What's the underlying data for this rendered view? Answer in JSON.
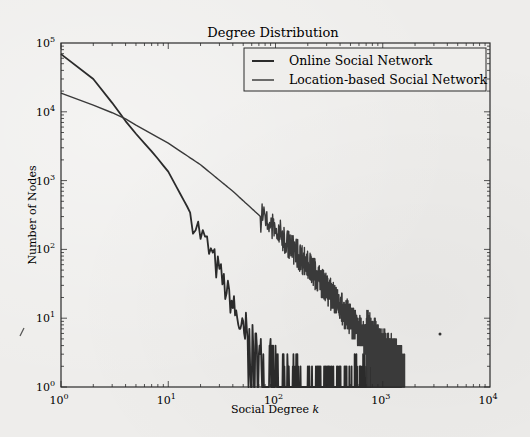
{
  "chart_data": {
    "type": "line",
    "title": "Degree Distribution",
    "xlabel": "Social Degree k",
    "xlabel_main": "Social Degree ",
    "xlabel_var": "k",
    "ylabel": "Number of Nodes",
    "xscale": "log",
    "yscale": "log",
    "xlim": [
      1,
      10000
    ],
    "ylim": [
      1,
      100000
    ],
    "x_ticks": [
      "10^0",
      "10^1",
      "10^2",
      "10^3",
      "10^4"
    ],
    "y_ticks": [
      "10^0",
      "10^1",
      "10^2",
      "10^3",
      "10^4",
      "10^5"
    ],
    "grid": false,
    "legend_position": "upper right",
    "series": [
      {
        "name": "Online Social Network",
        "color": "#2b2b2b",
        "points": [
          [
            1,
            69000
          ],
          [
            1.5,
            45000
          ],
          [
            2,
            30000
          ],
          [
            2.5,
            20000
          ],
          [
            3,
            13500
          ],
          [
            3.7,
            8500
          ],
          [
            5,
            4800
          ],
          [
            7.5,
            2350
          ],
          [
            10,
            1350
          ],
          [
            15,
            420
          ],
          [
            20,
            170
          ],
          [
            24,
            98
          ],
          [
            30,
            45
          ],
          [
            40,
            15
          ],
          [
            50,
            6
          ],
          [
            60,
            3
          ],
          [
            80,
            2
          ],
          [
            100,
            1.5
          ],
          [
            150,
            1
          ]
        ],
        "tail_max_k": 1500
      },
      {
        "name": "Location-based Social Network",
        "color": "#3a3a3a",
        "points": [
          [
            1,
            18700
          ],
          [
            2,
            12500
          ],
          [
            3.7,
            8500
          ],
          [
            5,
            6400
          ],
          [
            10,
            3500
          ],
          [
            20,
            1700
          ],
          [
            40,
            700
          ],
          [
            100,
            190
          ],
          [
            200,
            60
          ],
          [
            400,
            15
          ],
          [
            700,
            5
          ],
          [
            1000,
            2.5
          ],
          [
            1500,
            1.5
          ]
        ],
        "tail_max_k": 1600
      }
    ]
  }
}
